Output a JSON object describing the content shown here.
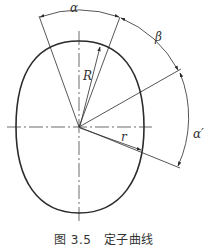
{
  "figure": {
    "caption": "图 3.5　定子曲线",
    "labels": {
      "alpha": "α",
      "beta": "β",
      "alpha_prime": "α′",
      "R": "R",
      "r": "r"
    },
    "colors": {
      "stroke": "#2b2b2b",
      "background": "#ffffff"
    }
  }
}
